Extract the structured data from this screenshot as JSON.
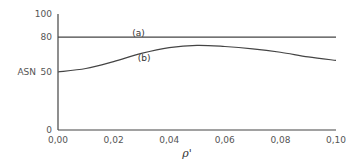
{
  "chart_data": {
    "type": "line",
    "title": "",
    "xlabel": "ρ'",
    "ylabel": "ASN",
    "xlim": [
      0.0,
      0.1
    ],
    "ylim": [
      0,
      100
    ],
    "grid": false,
    "legend": "inline labels",
    "x_ticks": [
      {
        "value": 0.0,
        "label": "0,00"
      },
      {
        "value": 0.02,
        "label": "0,02"
      },
      {
        "value": 0.04,
        "label": "0,04"
      },
      {
        "value": 0.06,
        "label": "0,06"
      },
      {
        "value": 0.08,
        "label": "0,08"
      },
      {
        "value": 0.1,
        "label": "0,10"
      }
    ],
    "y_ticks": [
      {
        "value": 0,
        "label": "0"
      },
      {
        "value": 50,
        "label": "50"
      },
      {
        "value": 80,
        "label": "80"
      },
      {
        "value": 100,
        "label": "100"
      }
    ],
    "series": [
      {
        "name": "(a)",
        "label_at": {
          "x": 0.029,
          "y": 84
        },
        "x": [
          0.0,
          0.1
        ],
        "values": [
          80,
          80
        ]
      },
      {
        "name": "(b)",
        "label_at": {
          "x": 0.031,
          "y": 62
        },
        "x": [
          0.0,
          0.01,
          0.02,
          0.03,
          0.04,
          0.05,
          0.06,
          0.07,
          0.08,
          0.09,
          0.1
        ],
        "values": [
          50,
          53,
          59,
          66,
          71,
          73,
          72,
          70,
          67,
          63,
          60
        ]
      }
    ]
  },
  "plot": {
    "left": 58,
    "right": 336,
    "top": 14,
    "bottom": 130,
    "line_color": "#444444"
  }
}
